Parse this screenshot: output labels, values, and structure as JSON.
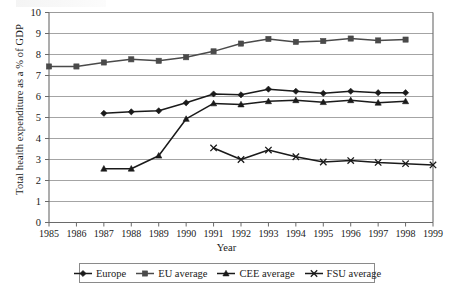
{
  "chart_data": {
    "type": "line",
    "title": "",
    "xlabel": "Year",
    "ylabel": "Total health expenditure as a % of GDP",
    "x": [
      1985,
      1986,
      1987,
      1988,
      1989,
      1990,
      1991,
      1992,
      1993,
      1994,
      1995,
      1996,
      1997,
      1998,
      1999
    ],
    "xtick_labels": [
      "1985",
      "1986",
      "1987",
      "1988",
      "1989",
      "1990",
      "1991",
      "1992",
      "1993",
      "1994",
      "1995",
      "1996",
      "1997",
      "1998",
      "1999"
    ],
    "ytick_labels": [
      "0",
      "1",
      "2",
      "3",
      "4",
      "5",
      "6",
      "7",
      "8",
      "9",
      "10"
    ],
    "ylim": [
      0,
      10
    ],
    "xlim": [
      1985,
      1999
    ],
    "grid": "horizontal",
    "legend_position": "bottom",
    "series": [
      {
        "name": "Europe",
        "marker": "diamond",
        "color": "#1a1a1a",
        "points": [
          {
            "x": 1987,
            "y": 5.2
          },
          {
            "x": 1988,
            "y": 5.27
          },
          {
            "x": 1989,
            "y": 5.32
          },
          {
            "x": 1990,
            "y": 5.7
          },
          {
            "x": 1991,
            "y": 6.12
          },
          {
            "x": 1992,
            "y": 6.08
          },
          {
            "x": 1993,
            "y": 6.35
          },
          {
            "x": 1994,
            "y": 6.25
          },
          {
            "x": 1995,
            "y": 6.15
          },
          {
            "x": 1996,
            "y": 6.25
          },
          {
            "x": 1997,
            "y": 6.18
          },
          {
            "x": 1998,
            "y": 6.18
          }
        ]
      },
      {
        "name": "EU average",
        "marker": "square",
        "color": "#4a4a4a",
        "points": [
          {
            "x": 1985,
            "y": 7.43
          },
          {
            "x": 1986,
            "y": 7.43
          },
          {
            "x": 1987,
            "y": 7.62
          },
          {
            "x": 1988,
            "y": 7.77
          },
          {
            "x": 1989,
            "y": 7.7
          },
          {
            "x": 1990,
            "y": 7.87
          },
          {
            "x": 1991,
            "y": 8.15
          },
          {
            "x": 1992,
            "y": 8.52
          },
          {
            "x": 1993,
            "y": 8.74
          },
          {
            "x": 1994,
            "y": 8.6
          },
          {
            "x": 1995,
            "y": 8.64
          },
          {
            "x": 1996,
            "y": 8.76
          },
          {
            "x": 1997,
            "y": 8.67
          },
          {
            "x": 1998,
            "y": 8.71
          }
        ]
      },
      {
        "name": "CEE average",
        "marker": "triangle",
        "color": "#1a1a1a",
        "points": [
          {
            "x": 1987,
            "y": 2.56
          },
          {
            "x": 1988,
            "y": 2.56
          },
          {
            "x": 1989,
            "y": 3.18
          },
          {
            "x": 1990,
            "y": 4.93
          },
          {
            "x": 1991,
            "y": 5.67
          },
          {
            "x": 1992,
            "y": 5.62
          },
          {
            "x": 1993,
            "y": 5.77
          },
          {
            "x": 1994,
            "y": 5.82
          },
          {
            "x": 1995,
            "y": 5.73
          },
          {
            "x": 1996,
            "y": 5.82
          },
          {
            "x": 1997,
            "y": 5.7
          },
          {
            "x": 1998,
            "y": 5.77
          }
        ]
      },
      {
        "name": "FSU average",
        "marker": "cross",
        "color": "#1a1a1a",
        "points": [
          {
            "x": 1991,
            "y": 3.55
          },
          {
            "x": 1992,
            "y": 3.0
          },
          {
            "x": 1993,
            "y": 3.45
          },
          {
            "x": 1994,
            "y": 3.13
          },
          {
            "x": 1995,
            "y": 2.88
          },
          {
            "x": 1996,
            "y": 2.95
          },
          {
            "x": 1997,
            "y": 2.86
          },
          {
            "x": 1998,
            "y": 2.8
          },
          {
            "x": 1999,
            "y": 2.74
          }
        ]
      }
    ]
  },
  "legend": {
    "items": [
      {
        "label": "Europe",
        "marker": "diamond"
      },
      {
        "label": "EU average",
        "marker": "square"
      },
      {
        "label": "CEE average",
        "marker": "triangle"
      },
      {
        "label": "FSU average",
        "marker": "cross"
      }
    ]
  },
  "axes": {
    "x_title": "Year",
    "y_title": "Total health expenditure as a % of GDP"
  },
  "colors": {
    "line": "#1a1a1a",
    "eu_line": "#4a4a4a",
    "grid": "#9a9a9a",
    "axis": "#6a6a6a",
    "background": "#ffffff"
  }
}
